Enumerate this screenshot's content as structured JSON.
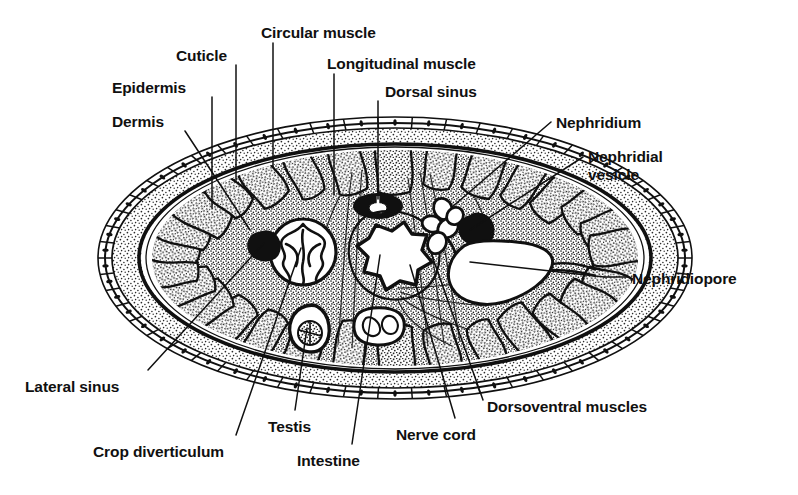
{
  "figure": {
    "width": 798,
    "height": 495,
    "background_color": "#ffffff",
    "ink_color": "#101010",
    "style": "black-and-white stippled line engraving"
  },
  "labels": [
    {
      "id": "dermis",
      "text": "Dermis",
      "x": 112,
      "y": 113,
      "align": "left"
    },
    {
      "id": "epidermis",
      "text": "Epidermis",
      "x": 112,
      "y": 79,
      "align": "left"
    },
    {
      "id": "cuticle",
      "text": "Cuticle",
      "x": 176,
      "y": 47,
      "align": "left"
    },
    {
      "id": "circular-muscle",
      "text": "Circular muscle",
      "x": 261,
      "y": 24,
      "align": "left"
    },
    {
      "id": "longitudinal-muscle",
      "text": "Longitudinal muscle",
      "x": 327,
      "y": 55,
      "align": "left"
    },
    {
      "id": "dorsal-sinus",
      "text": "Dorsal sinus",
      "x": 385,
      "y": 83,
      "align": "left"
    },
    {
      "id": "nephridium",
      "text": "Nephridium",
      "x": 556,
      "y": 114,
      "align": "left"
    },
    {
      "id": "nephridial-vesicle",
      "text": "Nephridial\nvesicle",
      "x": 588,
      "y": 148,
      "align": "left"
    },
    {
      "id": "nephridiopore",
      "text": "Nephridiopore",
      "x": 632,
      "y": 270,
      "align": "left"
    },
    {
      "id": "dorsoventral-muscles",
      "text": "Dorsoventral muscles",
      "x": 487,
      "y": 398,
      "align": "left"
    },
    {
      "id": "nerve-cord",
      "text": "Nerve cord",
      "x": 396,
      "y": 426,
      "align": "left"
    },
    {
      "id": "intestine",
      "text": "Intestine",
      "x": 297,
      "y": 452,
      "align": "left"
    },
    {
      "id": "crop-diverticulum",
      "text": "Crop diverticulum",
      "x": 93,
      "y": 443,
      "align": "left"
    },
    {
      "id": "testis",
      "text": "Testis",
      "x": 268,
      "y": 418,
      "align": "left"
    },
    {
      "id": "lateral-sinus",
      "text": "Lateral sinus",
      "x": 25,
      "y": 378,
      "align": "left"
    }
  ],
  "leader_lines": [
    {
      "id": "dermis",
      "points": "185,131 250,230"
    },
    {
      "id": "epidermis",
      "points": "212,97 212,208"
    },
    {
      "id": "cuticle",
      "points": "236,65 236,180"
    },
    {
      "id": "circular-muscle",
      "points": "273,43 273,167"
    },
    {
      "id": "longitudinal-muscle",
      "points": "334,74 334,195"
    },
    {
      "id": "dorsal-sinus",
      "points": "378,101 378,199"
    },
    {
      "id": "nephridium",
      "points": "551,122 452,207"
    },
    {
      "id": "nephridial-vesicle",
      "points": "583,157 470,230"
    },
    {
      "id": "nephridiopore",
      "points": "628,277 604,277"
    },
    {
      "id": "nephridiopore-inner",
      "points": "604,277 470,262"
    },
    {
      "id": "dorsoventral-muscles",
      "points": "483,400 430,250"
    },
    {
      "id": "nerve-cord",
      "points": "455,418 410,265"
    },
    {
      "id": "intestine",
      "points": "352,444 380,255"
    },
    {
      "id": "crop-diverticulum",
      "points": "236,435 301,248"
    },
    {
      "id": "testis",
      "points": "295,410 307,328"
    },
    {
      "id": "lateral-sinus",
      "points": "148,370 264,243"
    }
  ],
  "anatomy": {
    "body_outline": {
      "name": "body-wall-outer",
      "cx": 395,
      "cy": 258,
      "rx": 297,
      "ry": 140
    },
    "structures": [
      {
        "id": "cuticle-layer",
        "label": "Cuticle",
        "description": "thin outermost line around the body"
      },
      {
        "id": "epidermis-layer",
        "label": "Epidermis",
        "description": "single row of cells each with a dark nucleus"
      },
      {
        "id": "dermis-layer",
        "label": "Dermis",
        "description": "stippled connective layer beneath the epidermis"
      },
      {
        "id": "circular-muscle-layer",
        "label": "Circular muscle",
        "description": "dark thin band inside the dermis"
      },
      {
        "id": "longitudinal-muscle",
        "label": "Longitudinal muscle",
        "description": "ring of irregular muscle bundles around the coelom"
      },
      {
        "id": "dorsal-sinus",
        "label": "Dorsal sinus",
        "description": "dark ring with pale lumen at the dorsal midline"
      },
      {
        "id": "intestine",
        "label": "Intestine",
        "description": "central star-shaped lumen with folded wall"
      },
      {
        "id": "nerve-cord",
        "label": "Nerve cord",
        "description": "bilobed ventral cord below the intestine"
      },
      {
        "id": "lateral-sinus",
        "label": "Lateral sinus",
        "description": "solid black blob on the left side"
      },
      {
        "id": "crop-diverticulum",
        "label": "Crop diverticulum",
        "description": "round folded sac left of the intestine"
      },
      {
        "id": "testis",
        "label": "Testis",
        "description": "small oval follicle ventrolateral on the left"
      },
      {
        "id": "nephridium",
        "label": "Nephridium",
        "description": "coiled tubule on the right side"
      },
      {
        "id": "nephridial-vesicle",
        "label": "Nephridial vesicle",
        "description": "solid black rounded vesicle beside the nephridium"
      },
      {
        "id": "nephridiopore",
        "label": "Nephridiopore",
        "description": "duct from the pale bladder opening at the right body wall"
      },
      {
        "id": "dorsoventral-muscles",
        "label": "Dorsoventral muscles",
        "description": "fan of fine fibres running dorsoventrally"
      }
    ]
  }
}
